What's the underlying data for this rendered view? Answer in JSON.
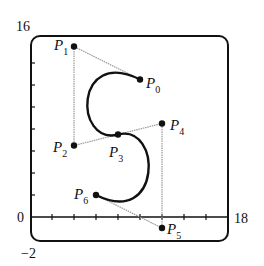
{
  "diagram": {
    "type": "piecewise-bezier-curve",
    "axes": {
      "x_min": 0,
      "x_max": 18,
      "y_min": -2,
      "y_max": 16,
      "x_tick_step": 2,
      "y_tick_step": 2,
      "labels": {
        "y_top": "16",
        "y_origin": "0",
        "y_bottom": "−2",
        "x_right": "18"
      }
    },
    "points": [
      {
        "name": "P",
        "sub": "0",
        "x": 10,
        "y": 12.5
      },
      {
        "name": "P",
        "sub": "1",
        "x": 4,
        "y": 15.5
      },
      {
        "name": "P",
        "sub": "2",
        "x": 4,
        "y": 6.5
      },
      {
        "name": "P",
        "sub": "3",
        "x": 8,
        "y": 7.5
      },
      {
        "name": "P",
        "sub": "4",
        "x": 12,
        "y": 8.5
      },
      {
        "name": "P",
        "sub": "5",
        "x": 12,
        "y": -1
      },
      {
        "name": "P",
        "sub": "6",
        "x": 6,
        "y": 2
      }
    ],
    "segments": [
      {
        "control_points": [
          "P0",
          "P1",
          "P2",
          "P3"
        ]
      },
      {
        "control_points": [
          "P3",
          "P4",
          "P5",
          "P6"
        ]
      }
    ],
    "colors": {
      "curve": "#111111",
      "control_polygon": "#9a9a9a",
      "frame": "#111111"
    }
  }
}
